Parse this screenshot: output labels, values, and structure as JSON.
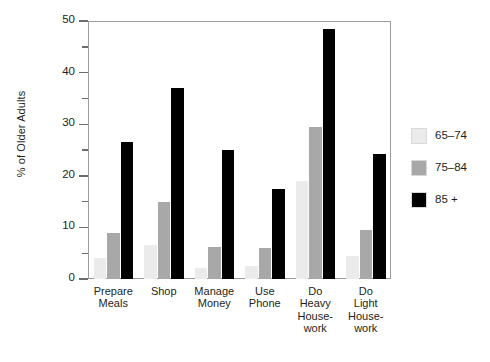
{
  "chart_data": {
    "type": "bar",
    "title": "",
    "xlabel": "",
    "ylabel": "% of Older Adults",
    "ylim": [
      0,
      50
    ],
    "ytick_major": [
      0,
      10,
      20,
      30,
      40,
      50
    ],
    "ytick_minor": [
      5,
      15,
      25,
      35,
      45
    ],
    "ytick_labels": [
      "0",
      "10",
      "20",
      "30",
      "40",
      "50"
    ],
    "grid": false,
    "legend_position": "right",
    "categories": [
      "Prepare\nMeals",
      "Shop",
      "Manage\nMoney",
      "Use\nPhone",
      "Do\nHeavy\nHouse-\nwork",
      "Do\nLight\nHouse-\nwork"
    ],
    "series": [
      {
        "name": "65–74",
        "color": "#ebebeb",
        "values": [
          4.0,
          6.5,
          2.2,
          2.5,
          19.0,
          4.5
        ]
      },
      {
        "name": "75–84",
        "color": "#a8a8a8",
        "values": [
          9.0,
          15.0,
          6.2,
          6.0,
          29.5,
          9.5
        ]
      },
      {
        "name": "85 +",
        "color": "#000000",
        "values": [
          26.5,
          37.0,
          25.0,
          17.5,
          48.5,
          24.2
        ]
      }
    ]
  },
  "legend": {
    "items": [
      {
        "label": "65–74",
        "color": "#ebebeb"
      },
      {
        "label": "75–84",
        "color": "#a8a8a8"
      },
      {
        "label": "85 +",
        "color": "#000000"
      }
    ]
  },
  "axis": {
    "y_title": "% of Older Adults"
  }
}
